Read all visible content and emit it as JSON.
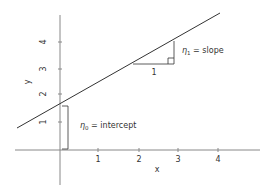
{
  "diagram": {
    "title": "",
    "axes": {
      "x_label": "x",
      "y_label": "y",
      "x_ticks": [
        "1",
        "2",
        "3",
        "4"
      ],
      "y_ticks": [
        "1",
        "2",
        "3",
        "4"
      ]
    },
    "annotations": {
      "intercept": {
        "symbol": "η",
        "subscript": "0",
        "text": " = intercept"
      },
      "slope": {
        "symbol": "η",
        "subscript": "1",
        "text": " = slope"
      },
      "run_label": "1"
    },
    "colors": {
      "axis": "#888888",
      "line": "#333333",
      "text": "#333333"
    }
  }
}
